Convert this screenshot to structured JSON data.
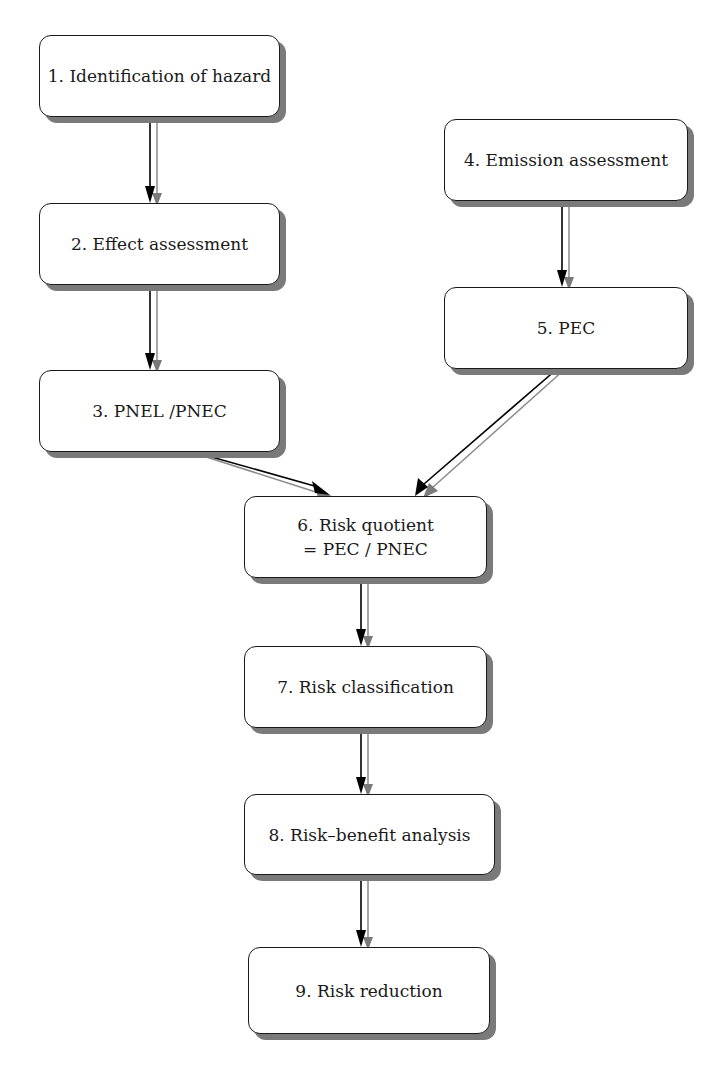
{
  "nodes": [
    {
      "id": 1,
      "label": "1. Identification of hazard"
    },
    {
      "id": 2,
      "label": "2. Effect assessment"
    },
    {
      "id": 3,
      "label": "3. PNEL /PNEC"
    },
    {
      "id": 4,
      "label": "4. Emission assessment"
    },
    {
      "id": 5,
      "label": "5. PEC"
    },
    {
      "id": 6,
      "label": "6. Risk quotient",
      "label2": "= PEC / PNEC"
    },
    {
      "id": 7,
      "label": "7. Risk classification"
    },
    {
      "id": 8,
      "label": "8. Risk–benefit analysis"
    },
    {
      "id": 9,
      "label": "9. Risk reduction"
    }
  ],
  "edges": [
    {
      "from": 1,
      "to": 2
    },
    {
      "from": 2,
      "to": 3
    },
    {
      "from": 4,
      "to": 5
    },
    {
      "from": 3,
      "to": 6
    },
    {
      "from": 5,
      "to": 6
    },
    {
      "from": 6,
      "to": 7
    },
    {
      "from": 7,
      "to": 8
    },
    {
      "from": 8,
      "to": 9
    }
  ],
  "colors": {
    "line": "#000000",
    "shadow_line": "#8a8a8a",
    "box_shadow": "#7a7a7a"
  }
}
